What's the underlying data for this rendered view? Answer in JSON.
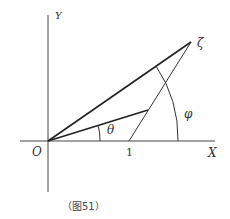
{
  "labels": {
    "y_axis": "Y",
    "x_axis": "X",
    "origin": "O",
    "one": "1",
    "zeta": "ζ",
    "theta": "θ",
    "phi": "φ"
  },
  "caption": "（图51）"
}
